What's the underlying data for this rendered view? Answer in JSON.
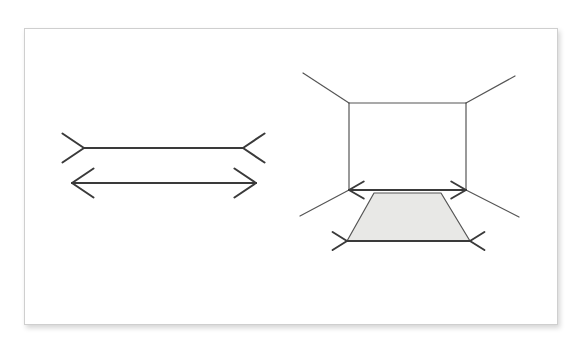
{
  "canvas": {
    "width": 580,
    "height": 347,
    "background": "#ffffff"
  },
  "card": {
    "x": 24,
    "y": 28,
    "width": 534,
    "height": 297,
    "fill": "#ffffff",
    "border_color": "#cfcfcf",
    "shadow": "rgba(0,0,0,0.17)"
  },
  "style": {
    "stroke": "#3a3a3a",
    "stroke_thin": "#555555",
    "stroke_width_thick": 2.0,
    "stroke_width_thin": 1.2,
    "floor_fill": "#e8e8e6"
  },
  "figures": [
    {
      "id": "muller-lyer",
      "name": "muller-lyer-figure",
      "description": "Two horizontal shafts of equal length; the upper shaft has outward-pointing arrowheads at both ends, the lower shaft has inward-pointing fins at both ends.",
      "shafts": [
        {
          "id": "upper-shaft",
          "name": "muller-lyer-upper-shaft",
          "x1": 84,
          "y1": 148,
          "x2": 243,
          "y2": 148,
          "fin_direction": "outward",
          "fin_length": 26,
          "fin_angle_deg": 34
        },
        {
          "id": "lower-shaft",
          "name": "muller-lyer-lower-shaft",
          "x1": 72,
          "y1": 183,
          "x2": 256,
          "y2": 183,
          "fin_direction": "inward",
          "fin_length": 26,
          "fin_angle_deg": 34
        }
      ]
    },
    {
      "id": "corridor-ponzo",
      "name": "corridor-perspective-figure",
      "description": "A rectangular back wall with four diagonal lines radiating outward from its corners, suggesting a room in perspective; a shaded trapezoid floor sits below the wall's base line.",
      "back_wall": {
        "id": "back-wall",
        "name": "back-wall-rectangle",
        "left": 349,
        "top": 103,
        "right": 466,
        "bottom": 190
      },
      "diagonals": [
        {
          "id": "diag-top-left",
          "name": "corner-diagonal-top-left",
          "x1": 349,
          "y1": 103,
          "x2": 303,
          "y2": 73
        },
        {
          "id": "diag-top-right",
          "name": "corner-diagonal-top-right",
          "x1": 466,
          "y1": 103,
          "x2": 515,
          "y2": 76
        },
        {
          "id": "diag-bottom-left",
          "name": "corner-diagonal-bottom-left",
          "x1": 349,
          "y1": 190,
          "x2": 300,
          "y2": 216
        },
        {
          "id": "diag-bottom-right",
          "name": "corner-diagonal-bottom-right",
          "x1": 466,
          "y1": 190,
          "x2": 519,
          "y2": 217
        }
      ],
      "wall_base_arrowheads": {
        "name": "wall-base-inward-arrowheads",
        "direction": "inward",
        "left_vertex": {
          "x": 349,
          "y": 190
        },
        "right_vertex": {
          "x": 466,
          "y": 190
        },
        "length": 17,
        "angle_deg": 30
      },
      "floor": {
        "id": "floor-trapezoid",
        "name": "floor-trapezoid",
        "fill": "#e8e8e6",
        "points": [
          {
            "x": 374,
            "y": 193
          },
          {
            "x": 441,
            "y": 193
          },
          {
            "x": 470,
            "y": 241
          },
          {
            "x": 347,
            "y": 241
          }
        ]
      },
      "floor_bottom_arrowheads": {
        "name": "floor-base-outward-arrowheads",
        "direction": "outward",
        "left_vertex": {
          "x": 347,
          "y": 241
        },
        "right_vertex": {
          "x": 470,
          "y": 241
        },
        "length": 17,
        "angle_deg": 32
      }
    }
  ]
}
